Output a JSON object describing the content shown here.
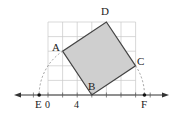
{
  "diagram": {
    "type": "geometry-square-on-grid",
    "origin_px": {
      "x": 48,
      "y": 95
    },
    "unit_px": 14.6,
    "grid": {
      "x_min": 0,
      "x_max": 6,
      "y_min": 0,
      "y_max": 5,
      "color": "#c8c8c8"
    },
    "axis": {
      "color": "#333333"
    },
    "square": {
      "fill": "#cfcfcf",
      "stroke": "#444444",
      "vertices": [
        {
          "name": "A",
          "x": 1,
          "y": 3
        },
        {
          "name": "B",
          "x": 3,
          "y": 0
        },
        {
          "name": "C",
          "x": 6,
          "y": 2
        },
        {
          "name": "D",
          "x": 4,
          "y": 5
        }
      ]
    },
    "arc_color": "#888888",
    "points_on_axis": [
      {
        "name": "E",
        "x": -0.606
      },
      {
        "name": "F",
        "x": 6.606
      }
    ]
  },
  "labels": {
    "A": "A",
    "B": "B",
    "C": "C",
    "D": "D",
    "E": "E",
    "F": "F",
    "ticks": [
      "0",
      "2",
      "4",
      "6"
    ]
  }
}
